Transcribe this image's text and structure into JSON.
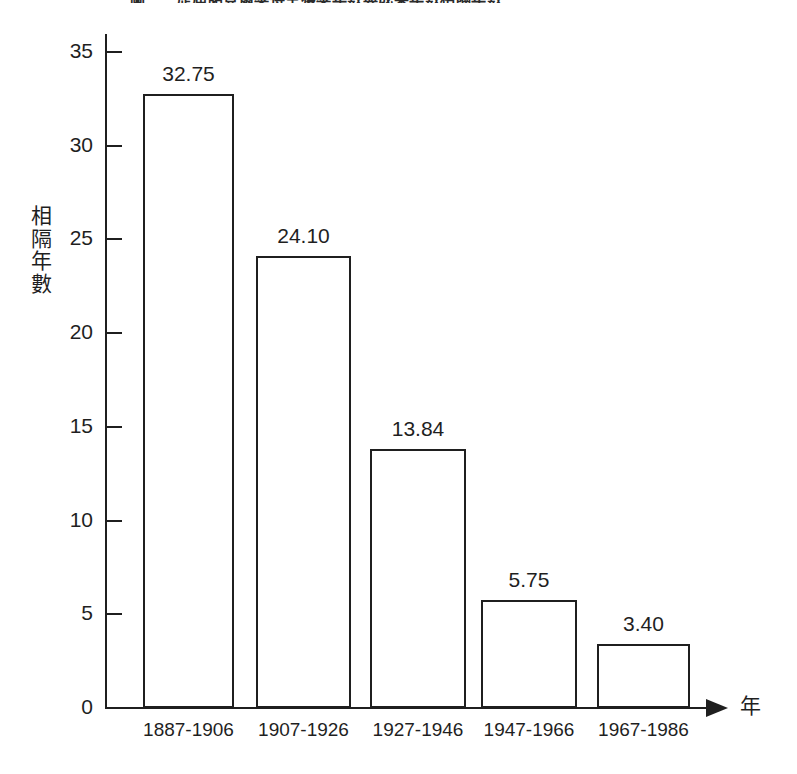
{
  "chart_data": {
    "type": "bar",
    "title": "圖一　歷屆諾貝爾獎得主獲獎年數與成果年數相隔年數",
    "xlabel": "年",
    "ylabel": "相隔年數",
    "categories": [
      "1887-1906",
      "1907-1926",
      "1927-1946",
      "1947-1966",
      "1967-1986"
    ],
    "values": [
      32.75,
      24.1,
      13.84,
      5.75,
      3.4
    ],
    "value_labels": [
      "32.75",
      "24.10",
      "13.84",
      "5.75",
      "3.40"
    ],
    "ylim": [
      0,
      36.5
    ],
    "yticks": [
      0,
      5,
      10,
      15,
      20,
      25,
      30,
      35
    ],
    "ytick_labels": [
      "0",
      "5",
      "10",
      "15",
      "20",
      "25",
      "30",
      "35"
    ],
    "grid": false,
    "legend": false,
    "bar_fill": "#ffffff",
    "bar_edge": "#1f1f1f",
    "axis_color": "#1f1f1f",
    "background": "#ffffff"
  }
}
